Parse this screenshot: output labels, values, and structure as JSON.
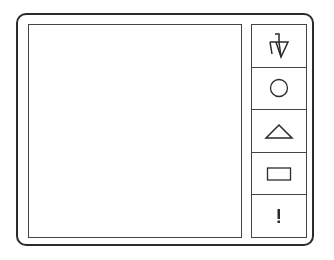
{
  "app": {
    "canvas": {
      "label": ""
    },
    "toolbar": {
      "tools": [
        {
          "name": "pen-tool",
          "icon": "pen-icon"
        },
        {
          "name": "circle-tool",
          "icon": "circle-icon"
        },
        {
          "name": "triangle-tool",
          "icon": "triangle-icon"
        },
        {
          "name": "rectangle-tool",
          "icon": "rectangle-icon"
        },
        {
          "name": "alert-tool",
          "icon": "exclamation-icon",
          "glyph": "!"
        }
      ]
    },
    "colors": {
      "stroke": "#2a2a2a",
      "background": "#ffffff"
    }
  }
}
